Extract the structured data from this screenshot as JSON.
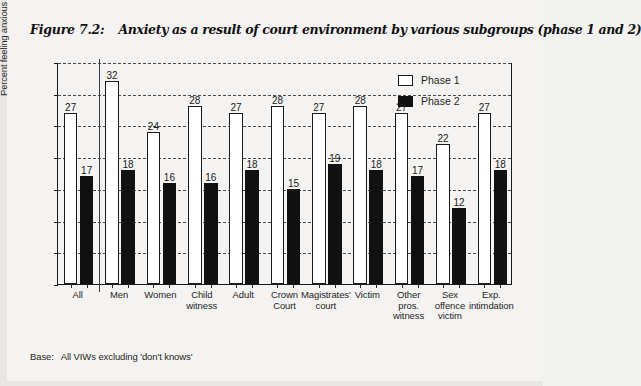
{
  "figure": {
    "number": "Figure 7.2:",
    "title": "Anxiety as a result of court environment by various subgroups (phase 1 and 2)",
    "footnote_label": "Base:",
    "footnote_text": "All VIWs excluding 'don't knows'"
  },
  "legend": {
    "items": [
      {
        "label": "Phase 1",
        "swatch": "white-square-outlined"
      },
      {
        "label": "Phase 2",
        "swatch": "black-square-filled"
      }
    ]
  },
  "chart_data": {
    "type": "bar",
    "title": "Anxiety as a result of court environment by various subgroups (phase 1 and 2)",
    "xlabel": "",
    "ylabel": "Percent feeling anxious",
    "ylim": [
      0,
      35
    ],
    "yticks": [
      0,
      5,
      10,
      15,
      20,
      25,
      30,
      35
    ],
    "grid": true,
    "grid_style": "dashed-horizontal",
    "legend_position": "top-right",
    "categories": [
      "All",
      "Men",
      "Women",
      "Child witness",
      "Adult",
      "Crown Court",
      "Magistrates' court",
      "Victim",
      "Other pros. witness",
      "Sex offence victim",
      "Exp. intimdation"
    ],
    "category_lines": [
      [
        "All"
      ],
      [
        "Men"
      ],
      [
        "Women"
      ],
      [
        "Child",
        "witness"
      ],
      [
        "Adult"
      ],
      [
        "Crown",
        "Court"
      ],
      [
        "Magistrates'",
        "court"
      ],
      [
        "Victim"
      ],
      [
        "Other",
        "pros.",
        "witness"
      ],
      [
        "Sex",
        "offence",
        "victim"
      ],
      [
        "Exp.",
        "intimdation"
      ]
    ],
    "series": [
      {
        "name": "Phase 1",
        "color": "#ffffff",
        "values": [
          27,
          32,
          24,
          28,
          27,
          28,
          27,
          28,
          27,
          22,
          27
        ]
      },
      {
        "name": "Phase 2",
        "color": "#111111",
        "values": [
          17,
          18,
          16,
          16,
          18,
          15,
          19,
          18,
          17,
          12,
          18
        ]
      }
    ]
  }
}
